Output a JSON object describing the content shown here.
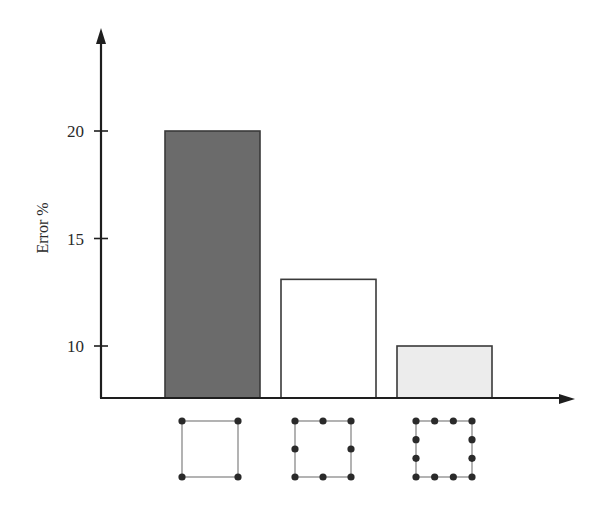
{
  "chart_data": {
    "type": "bar",
    "title": "",
    "xlabel": "",
    "ylabel": "Error %",
    "categories": [
      "4-node element",
      "8-node element",
      "12-node element"
    ],
    "values": [
      20,
      13.1,
      10
    ],
    "ylim": [
      7.6,
      25
    ],
    "yticks": [
      10,
      15,
      20
    ],
    "ytick_labels": [
      "10",
      "15",
      "20"
    ],
    "bar_colors": [
      "#6b6b6b",
      "#ffffff",
      "#ececec"
    ],
    "bar_edge_color": "#3a3a3a",
    "grid": false,
    "legend": null,
    "category_icons": [
      {
        "shape": "square",
        "nodes_per_side": 2,
        "total_nodes": 4
      },
      {
        "shape": "square",
        "nodes_per_side": 3,
        "total_nodes": 8
      },
      {
        "shape": "square",
        "nodes_per_side": 4,
        "total_nodes": 12
      }
    ]
  },
  "axis": {
    "ylabel": "Error %",
    "ticks": [
      {
        "label": "20",
        "value": 20
      },
      {
        "label": "15",
        "value": 15
      },
      {
        "label": "10",
        "value": 10
      }
    ]
  }
}
